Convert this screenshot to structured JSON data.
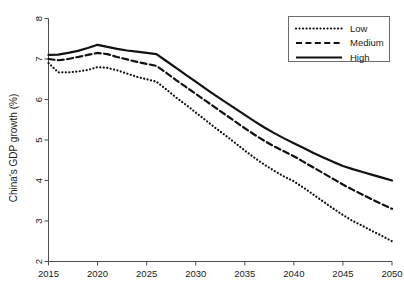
{
  "chart_data": {
    "type": "line",
    "title": "",
    "xlabel": "",
    "ylabel": "China's GDP growth (%)",
    "xlim": [
      2015,
      2050
    ],
    "ylim": [
      2,
      8
    ],
    "grid": false,
    "legend_position": "top-right",
    "xticks": [
      2015,
      2020,
      2025,
      2030,
      2035,
      2040,
      2045,
      2050
    ],
    "yticks": [
      2,
      3,
      4,
      5,
      6,
      7,
      8
    ],
    "xtick_labels": [
      "2015",
      "2020",
      "2025",
      "2030",
      "2035",
      "2040",
      "2045",
      "2050"
    ],
    "ytick_labels": [
      "2",
      "3",
      "4",
      "5",
      "6",
      "7",
      "8"
    ],
    "x": [
      2015,
      2016,
      2017,
      2018,
      2019,
      2020,
      2021,
      2022,
      2023,
      2024,
      2025,
      2026,
      2027,
      2028,
      2029,
      2030,
      2031,
      2032,
      2033,
      2034,
      2035,
      2036,
      2037,
      2038,
      2039,
      2040,
      2041,
      2042,
      2043,
      2044,
      2045,
      2046,
      2047,
      2048,
      2049,
      2050
    ],
    "series": [
      {
        "name": "Low",
        "style": "dotted",
        "color": "#111111",
        "values": [
          6.9,
          6.67,
          6.67,
          6.69,
          6.73,
          6.8,
          6.78,
          6.72,
          6.64,
          6.56,
          6.5,
          6.44,
          6.25,
          6.05,
          5.87,
          5.68,
          5.49,
          5.3,
          5.12,
          4.93,
          4.74,
          4.56,
          4.39,
          4.24,
          4.1,
          3.98,
          3.82,
          3.65,
          3.48,
          3.31,
          3.15,
          3.0,
          2.88,
          2.75,
          2.63,
          2.5
        ]
      },
      {
        "name": "Medium",
        "style": "dashed",
        "color": "#111111",
        "values": [
          7.0,
          6.97,
          7.0,
          7.05,
          7.1,
          7.15,
          7.12,
          7.05,
          6.99,
          6.93,
          6.88,
          6.83,
          6.66,
          6.48,
          6.31,
          6.14,
          5.97,
          5.8,
          5.63,
          5.46,
          5.29,
          5.13,
          4.98,
          4.84,
          4.72,
          4.6,
          4.46,
          4.32,
          4.18,
          4.04,
          3.9,
          3.77,
          3.65,
          3.53,
          3.41,
          3.3
        ]
      },
      {
        "name": "High",
        "style": "solid",
        "color": "#111111",
        "values": [
          7.1,
          7.11,
          7.15,
          7.2,
          7.27,
          7.35,
          7.3,
          7.25,
          7.21,
          7.18,
          7.15,
          7.12,
          6.95,
          6.78,
          6.61,
          6.44,
          6.27,
          6.1,
          5.94,
          5.78,
          5.62,
          5.46,
          5.31,
          5.17,
          5.04,
          4.92,
          4.8,
          4.68,
          4.57,
          4.46,
          4.36,
          4.28,
          4.21,
          4.14,
          4.07,
          4.0
        ]
      }
    ],
    "legend": [
      {
        "label": "Low",
        "style": "dotted"
      },
      {
        "label": "Medium",
        "style": "dashed"
      },
      {
        "label": "High",
        "style": "solid"
      }
    ]
  }
}
